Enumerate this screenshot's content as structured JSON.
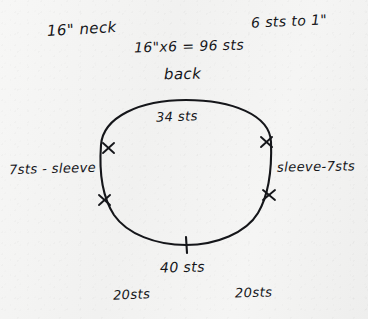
{
  "sketch": {
    "medium": "handwritten pencil sketch on paper",
    "subject": "knitting neckline stitch-distribution diagram",
    "paper_color": "#f4f4f3",
    "ink_color": "#15161a"
  },
  "annotations": {
    "neck_measure": "16\" neck",
    "gauge": "6 sts to 1\"",
    "calculation": "16\"x6 = 96 sts",
    "back_label": "back",
    "back_sts": "34 sts",
    "left_sleeve": "7sts - sleeve",
    "right_sleeve": "sleeve-7sts",
    "front_sts": "40 sts",
    "left_shoulder_sts": "20sts",
    "right_shoulder_sts": "20sts"
  },
  "diagram": {
    "shape": "ellipse",
    "center": {
      "x": 186,
      "y": 173
    },
    "radius_x": 86,
    "radius_y": 73,
    "markers": [
      {
        "name": "left-upper-marker",
        "x": 108,
        "y": 148,
        "style": "cross"
      },
      {
        "name": "left-lower-marker",
        "x": 104,
        "y": 200,
        "style": "cross"
      },
      {
        "name": "right-upper-marker",
        "x": 266,
        "y": 142,
        "style": "cross"
      },
      {
        "name": "right-lower-marker",
        "x": 269,
        "y": 195,
        "style": "cross"
      },
      {
        "name": "bottom-center-marker",
        "x": 186,
        "y": 245,
        "style": "tick"
      }
    ]
  }
}
